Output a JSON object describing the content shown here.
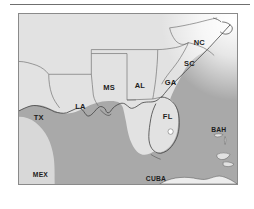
{
  "figure": {
    "kind": "reference-map",
    "frame_border_color": "#8a8a8a",
    "land_color": "#e2e2e2",
    "water_color": "#a9a9a9",
    "atlantic_highlight_color": "#ffffff",
    "boundary_color": "#6a6a6a",
    "coastline_color": "#4a4a4a",
    "label_color": "#1d1d1d"
  },
  "rule": {
    "present": true
  },
  "labels": {
    "states": [
      {
        "code": "NC",
        "name": "north-carolina",
        "x": 182,
        "y": 31
      },
      {
        "code": "SC",
        "name": "south-carolina",
        "x": 172,
        "y": 53
      },
      {
        "code": "MS",
        "name": "mississippi",
        "x": 97,
        "y": 77
      },
      {
        "code": "AL",
        "name": "alabama",
        "x": 125,
        "y": 75
      },
      {
        "code": "GA",
        "name": "georgia",
        "x": 155,
        "y": 72
      },
      {
        "code": "LA",
        "name": "louisiana",
        "x": 68,
        "y": 96
      },
      {
        "code": "TX",
        "name": "texas",
        "x": 36,
        "y": 107
      },
      {
        "code": "FL",
        "name": "florida",
        "x": 172,
        "y": 106
      }
    ],
    "countries": [
      {
        "code": "MEX",
        "name": "mexico",
        "x": 31,
        "y": 171
      },
      {
        "code": "CUBA",
        "name": "cuba",
        "x": 146,
        "y": 175
      },
      {
        "code": "BAH",
        "name": "bahamas",
        "x": 214,
        "y": 117
      }
    ]
  }
}
